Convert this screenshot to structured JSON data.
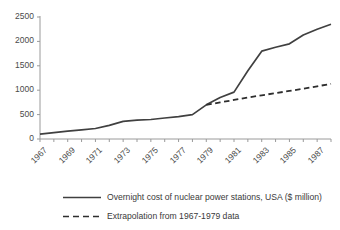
{
  "chart_data": {
    "type": "line",
    "title": "",
    "xlabel": "",
    "ylabel": "",
    "ylim": [
      0,
      2500
    ],
    "xlim": [
      1967,
      1988
    ],
    "yticks": [
      0,
      500,
      1000,
      1500,
      2000,
      2500
    ],
    "xticks": [
      1967,
      1969,
      1971,
      1973,
      1975,
      1977,
      1979,
      1981,
      1983,
      1985,
      1987
    ],
    "xtick_labels": [
      "1967",
      "1969",
      "1971",
      "1973",
      "1975",
      "1977",
      "1979",
      "1981",
      "1983",
      "1985",
      "1987"
    ],
    "ytick_labels": [
      "0",
      "500",
      "1000",
      "1500",
      "2000",
      "2500"
    ],
    "grid": false,
    "legend_position": "bottom",
    "line_color": "#404040",
    "axis_color": "#9a9a9a",
    "series": [
      {
        "name": "Overnight cost of nuclear power stations, USA ($ million)",
        "style": "solid",
        "x": [
          1967,
          1968,
          1969,
          1970,
          1971,
          1972,
          1973,
          1974,
          1975,
          1976,
          1977,
          1978,
          1979,
          1980,
          1981,
          1982,
          1983,
          1984,
          1985,
          1986,
          1987,
          1988
        ],
        "values": [
          100,
          130,
          160,
          185,
          215,
          280,
          360,
          385,
          400,
          430,
          460,
          500,
          700,
          850,
          960,
          1400,
          1800,
          1880,
          1950,
          2130,
          2250,
          2350
        ]
      },
      {
        "name": "Extrapolation from 1967-1979 data",
        "style": "dashed",
        "x": [
          1979,
          1980,
          1981,
          1982,
          1983,
          1984,
          1985,
          1986,
          1987,
          1988
        ],
        "values": [
          700,
          750,
          800,
          850,
          895,
          940,
          985,
          1030,
          1080,
          1130
        ]
      }
    ]
  },
  "legend": {
    "entries": [
      {
        "label": "Overnight cost of nuclear power stations, USA ($ million)",
        "style": "solid"
      },
      {
        "label": "Extrapolation from 1967-1979 data",
        "style": "dashed"
      }
    ]
  }
}
